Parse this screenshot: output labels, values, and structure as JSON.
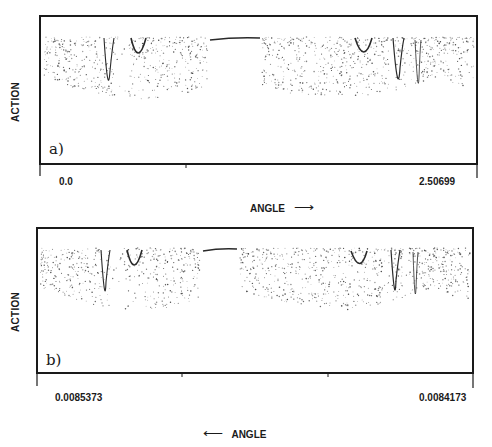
{
  "chart_data": [
    {
      "type": "scatter",
      "panel": "a)",
      "title": "",
      "xlabel": "ANGLE",
      "xlabel_arrow": "right",
      "ylabel": "ACTION",
      "x_ticks": [
        "0.0",
        "2.50699"
      ],
      "xlim": [
        0.0,
        2.50699
      ],
      "grid": false,
      "legend": null,
      "features": {
        "chaotic_sea": "dense dots in upper ~40% of frame with gaps at resonances",
        "resonance_minima_left": [
          {
            "x_frac": 0.16,
            "depth_frac": 0.42
          },
          {
            "x_frac": 0.23,
            "depth_frac": 0.27
          }
        ],
        "flat_curve_center": {
          "x_start_frac": 0.39,
          "x_end_frac": 0.51
        },
        "resonance_minima_right": [
          {
            "x_frac": 0.75,
            "depth_frac": 0.27
          },
          {
            "x_frac": 0.83,
            "depth_frac": 0.42
          },
          {
            "x_frac": 0.86,
            "depth_frac": 0.5
          }
        ]
      }
    },
    {
      "type": "scatter",
      "panel": "b)",
      "title": "",
      "xlabel": "ANGLE",
      "xlabel_arrow": "left",
      "ylabel": "ACTION",
      "x_ticks": [
        "0.0085373",
        "0.0084173"
      ],
      "xlim": [
        0.0085373,
        0.0084173
      ],
      "grid": false,
      "legend": null,
      "features": {
        "chaotic_sea": "dense dots in upper ~40% of frame, self-similar to panel a",
        "resonance_minima_left": [
          {
            "x_frac": 0.16,
            "depth_frac": 0.42
          },
          {
            "x_frac": 0.23,
            "depth_frac": 0.27
          }
        ],
        "flat_curve_center": {
          "x_start_frac": 0.38,
          "x_end_frac": 0.46
        },
        "resonance_minima_right": [
          {
            "x_frac": 0.74,
            "depth_frac": 0.27
          },
          {
            "x_frac": 0.82,
            "depth_frac": 0.42
          },
          {
            "x_frac": 0.86,
            "depth_frac": 0.5
          }
        ]
      }
    }
  ],
  "panels": {
    "a": {
      "tag": "a)",
      "ylabel": "ACTION",
      "x_start": "0.0",
      "x_end": "2.50699",
      "xlabel": "ANGLE",
      "arrow": "⟶"
    },
    "b": {
      "tag": "b)",
      "ylabel": "ACTION",
      "x_start": "0.0085373",
      "x_end": "0.0084173",
      "xlabel": "ANGLE",
      "arrow": "⟵"
    }
  },
  "colors": {
    "ink": "#1a1a1a",
    "dots": "#3a3a3a",
    "background": "#ffffff"
  }
}
